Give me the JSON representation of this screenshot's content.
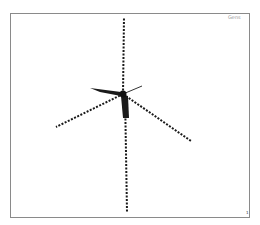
{
  "diagram": {
    "corner_label": "Gens",
    "page_mark": "1",
    "hub": {
      "x": 123,
      "y": 94
    },
    "colors": {
      "line": "#1a1a1a",
      "frame": "#8a8a8a",
      "label": "#9a9a9a"
    },
    "arms": [
      {
        "name": "up",
        "x2": 124,
        "y2": 17
      },
      {
        "name": "down",
        "x2": 127,
        "y2": 212
      },
      {
        "name": "left-long",
        "x2": 56,
        "y2": 127
      },
      {
        "name": "right-long",
        "x2": 191,
        "y2": 141
      },
      {
        "name": "up-right-short",
        "x2": 142,
        "y2": 86
      }
    ]
  }
}
